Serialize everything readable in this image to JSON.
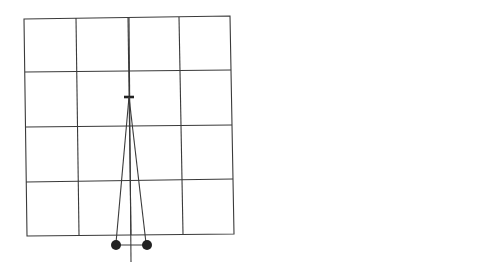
{
  "panel_a": {
    "label": "a",
    "grid": {
      "rows": 4,
      "cols": 4
    }
  },
  "panel_b": {
    "label": "b",
    "depth_label": "D",
    "depth_sub": "a",
    "axis_label": "θ",
    "top_panels": [
      {
        "id": "left",
        "name": "A",
        "sub": "L"
      },
      {
        "id": "right",
        "name": "A",
        "sub": "R"
      }
    ],
    "rows": [
      {
        "id": "T",
        "name": "T",
        "show_theta": false,
        "profile": "narrow"
      },
      {
        "id": "N",
        "name": "N",
        "show_theta": true,
        "profile": "broad"
      },
      {
        "id": "B",
        "name": "B",
        "show_theta": false,
        "profile": "narrow"
      }
    ],
    "sides": [
      "L",
      "R"
    ]
  }
}
